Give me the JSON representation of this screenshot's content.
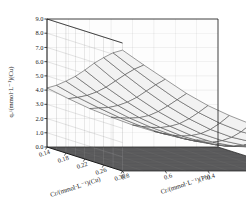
{
  "figure": {
    "kind": "3d-surface-plot",
    "background_color": "#ffffff",
    "wall_left_color": "#b9b9b9",
    "wall_right_color": "#fdfdfd",
    "floor_color": "#58585a",
    "surface_fill_color": "#f2f2f2",
    "mesh_line_color": "#4a4a4a",
    "axis_line_color": "#1a1a1a",
    "grid_line_color": "#9a9a9a"
  },
  "axes": {
    "z": {
      "label": "qₑ/(mmol·L⁻¹)(Cu)",
      "ticks": [
        "9.0",
        "8.0",
        "7.0",
        "6.0",
        "5.0",
        "4.0",
        "3.0",
        "2.0",
        "1.0",
        "0.0"
      ],
      "min": 0.0,
      "max": 9.0,
      "step": 1.0
    },
    "x": {
      "label": "Cr/(mmol·L⁻¹)(Cu)",
      "ticks": [
        "0.14",
        "0.18",
        "0.22",
        "0.26",
        "0.30"
      ],
      "min": 0.14,
      "max": 0.3
    },
    "y": {
      "label": "Cr/(mmol·L⁻¹)(Pb)",
      "ticks": [
        "0.8",
        "0.6",
        "0.4",
        "0.2",
        "0"
      ],
      "min": 0.0,
      "max": 0.8
    }
  },
  "chart_data": {
    "type": "surface",
    "title": "",
    "xlabel": "Cr/(mmol·L⁻¹)(Cu)",
    "ylabel": "Cr/(mmol·L⁻¹)(Pb)",
    "zlabel": "qₑ/(mmol·L⁻¹)(Cu)",
    "xlim": [
      0.14,
      0.3
    ],
    "ylim": [
      0.0,
      0.8
    ],
    "zlim": [
      0.0,
      9.0
    ],
    "grid": true,
    "legend": "none",
    "x": [
      0.14,
      0.16,
      0.18,
      0.2,
      0.22,
      0.24,
      0.26,
      0.28,
      0.3
    ],
    "y": [
      0.8,
      0.7,
      0.6,
      0.5,
      0.4,
      0.3,
      0.2,
      0.1,
      0.0
    ],
    "z": [
      [
        4.15,
        4.55,
        5.05,
        5.6,
        6.25,
        6.95,
        7.55,
        8.1,
        8.5
      ],
      [
        3.4,
        3.7,
        4.05,
        4.5,
        5.05,
        5.7,
        6.35,
        6.95,
        7.45
      ],
      [
        2.7,
        2.95,
        3.2,
        3.55,
        4.0,
        4.55,
        5.2,
        5.85,
        6.45
      ],
      [
        2.1,
        2.25,
        2.45,
        2.7,
        3.05,
        3.55,
        4.15,
        4.8,
        5.45
      ],
      [
        1.55,
        1.65,
        1.8,
        2.0,
        2.3,
        2.7,
        3.25,
        3.9,
        4.6
      ],
      [
        1.1,
        1.15,
        1.25,
        1.4,
        1.65,
        2.0,
        2.5,
        3.15,
        3.9
      ],
      [
        0.75,
        0.78,
        0.85,
        0.98,
        1.18,
        1.5,
        1.95,
        2.55,
        3.3
      ],
      [
        0.5,
        0.52,
        0.58,
        0.7,
        0.9,
        1.18,
        1.6,
        2.15,
        2.85
      ],
      [
        0.4,
        0.42,
        0.5,
        0.65,
        0.9,
        1.25,
        1.7,
        2.25,
        2.95
      ]
    ],
    "z_min_observed": 0.4,
    "z_max_observed": 8.5
  }
}
